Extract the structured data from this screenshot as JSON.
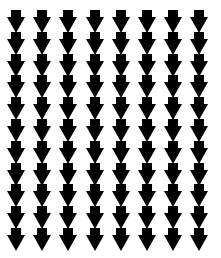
{
  "pattern": {
    "shape": "down-arrow",
    "columns": 8,
    "rows": 11,
    "fill_color": "#000000",
    "background_color": "#ffffff",
    "origin_x": 7,
    "origin_y": 10,
    "col_pitch": 26.2,
    "row_pitch": 21.8
  }
}
